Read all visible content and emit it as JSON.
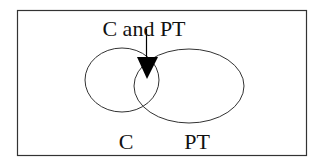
{
  "diagram": {
    "type": "venn",
    "title_label": "C and PT",
    "sets": [
      {
        "id": "C",
        "label": "C"
      },
      {
        "id": "PT",
        "label": "PT"
      }
    ],
    "intersection_label": "C and PT",
    "colors": {
      "background": "#ffffff",
      "stroke": "#333333",
      "arrow": "#000000",
      "text": "#111111"
    }
  }
}
